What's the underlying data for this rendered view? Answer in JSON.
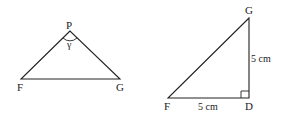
{
  "figures": [
    {
      "name": "triangle-FPG",
      "vertices": {
        "P": {
          "label": "P",
          "x": 70,
          "y": 31
        },
        "F": {
          "label": "F",
          "x": 21,
          "y": 79
        },
        "G": {
          "label": "G",
          "x": 120,
          "y": 79
        }
      },
      "angle_label": "γ"
    },
    {
      "name": "right-triangle-FDG",
      "vertices": {
        "G": {
          "label": "G",
          "x": 249,
          "y": 18
        },
        "F": {
          "label": "F",
          "x": 168,
          "y": 98
        },
        "D": {
          "label": "D",
          "x": 249,
          "y": 98
        }
      },
      "side_labels": {
        "GD": "5 cm",
        "FD": "5 cm"
      },
      "right_angle_at": "D"
    }
  ],
  "colors": {
    "stroke": "#222222",
    "background": "#ffffff"
  }
}
